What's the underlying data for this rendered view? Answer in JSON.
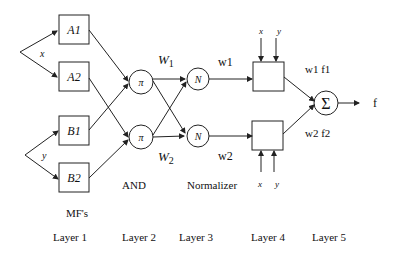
{
  "diagram": {
    "inputs": {
      "x": "x",
      "y": "y"
    },
    "layer1": {
      "nodes": [
        "A1",
        "A2",
        "B1",
        "B2"
      ],
      "caption": "MF's"
    },
    "layer2": {
      "nodes": [
        "π",
        "π"
      ],
      "outputs": [
        "W1",
        "W2"
      ],
      "w_sub": [
        "1",
        "2"
      ],
      "caption": "AND"
    },
    "layer3": {
      "nodes": [
        "N",
        "N"
      ],
      "outputs": [
        "w1",
        "w2"
      ],
      "caption": "Normalizer"
    },
    "layer4": {
      "inputs_top": [
        "x",
        "y"
      ],
      "inputs_bottom": [
        "x",
        "y"
      ],
      "outputs": [
        "w1 f1",
        "w2 f2"
      ]
    },
    "layer5": {
      "node": "Σ",
      "output": "f"
    },
    "layer_labels": [
      "Layer 1",
      "Layer 2",
      "Layer 3",
      "Layer 4",
      "Layer 5"
    ]
  }
}
